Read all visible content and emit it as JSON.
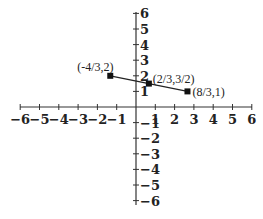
{
  "chart_data": {
    "type": "line",
    "title": "",
    "xlabel": "",
    "ylabel": "",
    "xlim": [
      -6,
      6
    ],
    "ylim": [
      -6,
      6
    ],
    "grid": false,
    "x_ticks": [
      -6,
      -5,
      -4,
      -3,
      -2,
      -1,
      1,
      2,
      3,
      4,
      5,
      6
    ],
    "y_ticks": [
      6,
      5,
      4,
      3,
      2,
      1,
      -1,
      -2,
      -3,
      -4,
      -5,
      -6
    ],
    "series": [
      {
        "name": "segment",
        "points": [
          {
            "x": -1.3333,
            "y": 2,
            "label": "(-4/3,2)"
          },
          {
            "x": 0.6667,
            "y": 1.5,
            "label": "(2/3,3/2)"
          },
          {
            "x": 2.6667,
            "y": 1,
            "label": "(8/3,1)"
          }
        ]
      }
    ],
    "colors": {
      "line": "#222222",
      "axis": "#333333"
    }
  },
  "labels": {
    "x_ticks": [
      "-6",
      "-5",
      "-4",
      "-3",
      "-2",
      "-1",
      "1",
      "2",
      "3",
      "4",
      "5",
      "6"
    ],
    "y_ticks": [
      "6",
      "5",
      "4",
      "3",
      "2",
      "1",
      "-1",
      "-2",
      "-3",
      "-4",
      "-5",
      "-6"
    ],
    "points": [
      "(-4/3,2)",
      "(2/3,3/2)",
      "(8/3,1)"
    ]
  }
}
